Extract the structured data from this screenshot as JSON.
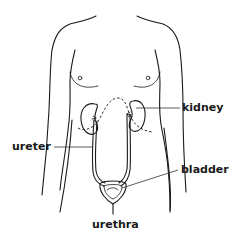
{
  "diagram": {
    "labels": {
      "kidney": "kidney",
      "ureter": "ureter",
      "bladder": "bladder",
      "urethra": "urethra"
    },
    "colors": {
      "line": "#1a1a1a",
      "background": "#ffffff",
      "text": "#1a1a1a"
    }
  }
}
